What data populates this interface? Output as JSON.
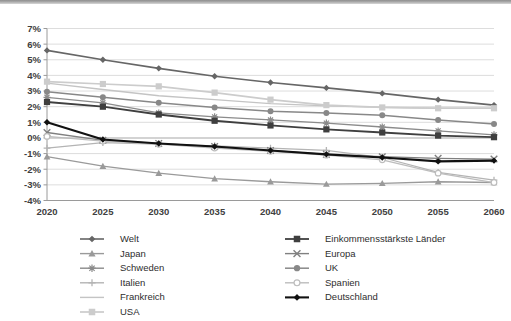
{
  "chart_data": {
    "type": "line",
    "title": "",
    "subtitle": "",
    "xlabel": "",
    "ylabel": "",
    "categories": [
      "2020",
      "2025",
      "2030",
      "2035",
      "2040",
      "2045",
      "2050",
      "2055",
      "2060"
    ],
    "x": [
      2020,
      2025,
      2030,
      2035,
      2040,
      2045,
      2050,
      2055,
      2060
    ],
    "ylim": [
      -4,
      7
    ],
    "ytick_labels": [
      "7%",
      "6%",
      "5%",
      "4%",
      "3%",
      "2%",
      "1%",
      "0%",
      "-1%",
      "-2%",
      "-3%",
      "-4%"
    ],
    "ytick_values": [
      7,
      6,
      5,
      4,
      3,
      2,
      1,
      0,
      -1,
      -2,
      -3,
      -4
    ],
    "yunit": "%",
    "grid": true,
    "grid_axis": "y",
    "legend_position": "bottom",
    "legend_columns": 2,
    "series": [
      {
        "name": "Welt",
        "marker": "diamond",
        "color": "#666666",
        "width": 1.6,
        "values": [
          5.6,
          5.0,
          4.45,
          3.95,
          3.55,
          3.2,
          2.85,
          2.45,
          2.1
        ]
      },
      {
        "name": "Japan",
        "marker": "triangle",
        "color": "#9a9a9a",
        "width": 1.3,
        "values": [
          -1.2,
          -1.8,
          -2.25,
          -2.6,
          -2.8,
          -2.95,
          -2.9,
          -2.8,
          -2.85
        ]
      },
      {
        "name": "Schweden",
        "marker": "asterisk",
        "color": "#8b8b8b",
        "width": 1.3,
        "values": [
          2.6,
          2.25,
          1.6,
          1.35,
          1.15,
          0.95,
          0.7,
          0.45,
          0.2
        ]
      },
      {
        "name": "Italien",
        "marker": "plus",
        "color": "#b4b4b4",
        "width": 1.2,
        "values": [
          -0.65,
          -0.3,
          -0.4,
          -0.5,
          -0.65,
          -0.8,
          -1.25,
          -2.2,
          -2.7
        ]
      },
      {
        "name": "Frankreich",
        "marker": "none",
        "color": "#c4c4c4",
        "width": 1.3,
        "values": [
          3.5,
          3.1,
          2.7,
          2.45,
          2.2,
          2.05,
          1.95,
          1.9,
          1.9
        ]
      },
      {
        "name": "USA",
        "marker": "square",
        "color": "#cccccc",
        "width": 1.7,
        "values": [
          3.6,
          3.45,
          3.3,
          2.9,
          2.45,
          2.1,
          1.95,
          1.9,
          1.9
        ]
      },
      {
        "name": "Einkommensstärkste Länder",
        "marker": "square",
        "color": "#3f3f3f",
        "width": 1.8,
        "values": [
          2.3,
          2.0,
          1.5,
          1.1,
          0.8,
          0.55,
          0.35,
          0.15,
          0.05
        ]
      },
      {
        "name": "Europa",
        "marker": "x",
        "color": "#808080",
        "width": 1.3,
        "values": [
          0.35,
          -0.15,
          -0.35,
          -0.55,
          -0.8,
          -1.05,
          -1.2,
          -1.3,
          -1.35
        ]
      },
      {
        "name": "UK",
        "marker": "circle",
        "color": "#888888",
        "width": 1.5,
        "values": [
          2.95,
          2.6,
          2.25,
          1.95,
          1.7,
          1.6,
          1.45,
          1.15,
          0.9
        ]
      },
      {
        "name": "Spanien",
        "marker": "circle-open",
        "color": "#bdbdbd",
        "width": 1.3,
        "values": [
          0.1,
          -0.2,
          -0.4,
          -0.65,
          -0.85,
          -1.1,
          -1.4,
          -2.25,
          -2.85
        ]
      },
      {
        "name": "Deutschland",
        "marker": "diamond",
        "color": "#111111",
        "width": 2.1,
        "values": [
          1.0,
          -0.1,
          -0.35,
          -0.55,
          -0.8,
          -1.05,
          -1.25,
          -1.5,
          -1.45
        ]
      }
    ],
    "legend_order_left": [
      "Welt",
      "Japan",
      "Schweden",
      "Italien",
      "Frankreich",
      "USA"
    ],
    "legend_order_right": [
      "Einkommensstärkste Länder",
      "Europa",
      "UK",
      "Spanien",
      "Deutschland"
    ]
  }
}
